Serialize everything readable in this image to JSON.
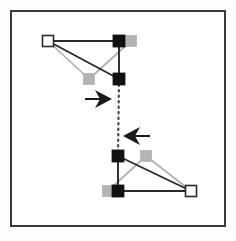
{
  "figure": {
    "width": 236,
    "height": 241,
    "background_color": "#fdfdfd",
    "panel_background_color": "#ffffff"
  },
  "frame": {
    "name": "outer-border",
    "x": 11,
    "y": 11,
    "width": 214,
    "height": 215,
    "stroke_color": "#3a3a3a",
    "stroke_width": 2.0
  },
  "palette": {
    "dark": "#1a1a1a",
    "mid_dark": "#4a4a4a",
    "gray": "#a8a8a8",
    "light_gray": "#c0c0c0",
    "white": "#ffffff",
    "frame": "#3a3a3a"
  },
  "markers": {
    "size_filled": 12,
    "size_gray": 11,
    "size_hollow": 11,
    "hollow_stroke_width": 1.6,
    "items": [
      {
        "id": "top-hollow-vertex",
        "group": "top",
        "style": "hollow",
        "fill": "#ffffff",
        "stroke": "#2a2a2a",
        "cx": 48,
        "cy": 41,
        "size": 11
      },
      {
        "id": "top-black-upper-right",
        "group": "top",
        "style": "filled",
        "fill": "#111111",
        "stroke": "#111111",
        "cx": 119,
        "cy": 41,
        "size": 12
      },
      {
        "id": "top-black-lower-right",
        "group": "top",
        "style": "filled",
        "fill": "#111111",
        "stroke": "#111111",
        "cx": 119,
        "cy": 79,
        "size": 12
      },
      {
        "id": "top-gray-upper-right",
        "group": "top",
        "style": "gray",
        "fill": "#b4b4b4",
        "stroke": "#b4b4b4",
        "cx": 131,
        "cy": 41,
        "size": 11
      },
      {
        "id": "top-gray-middle",
        "group": "top",
        "style": "gray",
        "fill": "#b4b4b4",
        "stroke": "#b4b4b4",
        "cx": 89,
        "cy": 79,
        "size": 11
      },
      {
        "id": "bottom-black-upper-left",
        "group": "bottom",
        "style": "filled",
        "fill": "#111111",
        "stroke": "#111111",
        "cx": 118,
        "cy": 156,
        "size": 12
      },
      {
        "id": "bottom-black-lower-left",
        "group": "bottom",
        "style": "filled",
        "fill": "#111111",
        "stroke": "#111111",
        "cx": 118,
        "cy": 191,
        "size": 12
      },
      {
        "id": "bottom-gray-upper",
        "group": "bottom",
        "style": "gray",
        "fill": "#b4b4b4",
        "stroke": "#b4b4b4",
        "cx": 146,
        "cy": 156,
        "size": 11
      },
      {
        "id": "bottom-gray-lower-left",
        "group": "bottom",
        "style": "gray",
        "fill": "#b4b4b4",
        "stroke": "#b4b4b4",
        "cx": 108,
        "cy": 191,
        "size": 11
      },
      {
        "id": "bottom-hollow-vertex",
        "group": "bottom",
        "style": "hollow",
        "fill": "#ffffff",
        "stroke": "#2a2a2a",
        "cx": 191,
        "cy": 191,
        "size": 11
      }
    ]
  },
  "edges": [
    {
      "id": "top-dark-top-edge",
      "group": "top",
      "shade": "dark",
      "color": "#2a2a2a",
      "width": 1.9,
      "x1": 48,
      "y1": 41,
      "x2": 119,
      "y2": 41
    },
    {
      "id": "top-dark-right-edge",
      "group": "top",
      "shade": "dark",
      "color": "#2a2a2a",
      "width": 1.9,
      "x1": 119,
      "y1": 41,
      "x2": 119,
      "y2": 79
    },
    {
      "id": "top-dark-hypotenuse",
      "group": "top",
      "shade": "dark",
      "color": "#2a2a2a",
      "width": 1.9,
      "x1": 48,
      "y1": 41,
      "x2": 119,
      "y2": 79
    },
    {
      "id": "top-gray-top-edge",
      "group": "top",
      "shade": "gray",
      "color": "#b0b0b0",
      "width": 1.7,
      "x1": 48,
      "y1": 41,
      "x2": 131,
      "y2": 41
    },
    {
      "id": "top-gray-right-edge",
      "group": "top",
      "shade": "gray",
      "color": "#b0b0b0",
      "width": 1.7,
      "x1": 131,
      "y1": 41,
      "x2": 89,
      "y2": 79
    },
    {
      "id": "top-gray-hypotenuse",
      "group": "top",
      "shade": "gray",
      "color": "#b0b0b0",
      "width": 1.7,
      "x1": 48,
      "y1": 41,
      "x2": 89,
      "y2": 79
    },
    {
      "id": "bottom-dark-left-edge",
      "group": "bottom",
      "shade": "dark",
      "color": "#2a2a2a",
      "width": 1.9,
      "x1": 118,
      "y1": 156,
      "x2": 118,
      "y2": 191
    },
    {
      "id": "bottom-dark-bottom-edge",
      "group": "bottom",
      "shade": "dark",
      "color": "#2a2a2a",
      "width": 1.9,
      "x1": 118,
      "y1": 191,
      "x2": 191,
      "y2": 191
    },
    {
      "id": "bottom-dark-hypotenuse",
      "group": "bottom",
      "shade": "dark",
      "color": "#2a2a2a",
      "width": 1.9,
      "x1": 118,
      "y1": 156,
      "x2": 191,
      "y2": 191
    },
    {
      "id": "bottom-gray-left-edge",
      "group": "bottom",
      "shade": "gray",
      "color": "#b0b0b0",
      "width": 1.7,
      "x1": 146,
      "y1": 156,
      "x2": 108,
      "y2": 191
    },
    {
      "id": "bottom-gray-bottom-edge",
      "group": "bottom",
      "shade": "gray",
      "color": "#b0b0b0",
      "width": 1.7,
      "x1": 108,
      "y1": 191,
      "x2": 191,
      "y2": 191
    },
    {
      "id": "bottom-gray-hypotenuse",
      "group": "bottom",
      "shade": "gray",
      "color": "#b0b0b0",
      "width": 1.7,
      "x1": 146,
      "y1": 156,
      "x2": 191,
      "y2": 191
    }
  ],
  "connector": {
    "id": "dotted-correspondence-line",
    "color": "#4a4a4a",
    "width": 2.2,
    "dash_pattern": "1.5 4",
    "x1": 119,
    "y1": 79,
    "x2": 118,
    "y2": 156
  },
  "arrows": [
    {
      "id": "arrow-right",
      "direction": "right",
      "color": "#1a1a1a",
      "tip_x": 112,
      "tip_y": 99,
      "tail_x": 85,
      "tail_y": 99,
      "head_length": 17,
      "head_half_height": 9,
      "notch": 5,
      "shaft_width": 2.0
    },
    {
      "id": "arrow-left",
      "direction": "left",
      "color": "#1a1a1a",
      "tip_x": 123,
      "tip_y": 136,
      "tail_x": 150,
      "tail_y": 136,
      "head_length": 17,
      "head_half_height": 9,
      "notch": 5,
      "shaft_width": 2.0
    }
  ],
  "chart_data": {
    "type": "scatter",
    "xlabel": "",
    "ylabel": "",
    "xlim": [
      11,
      225
    ],
    "ylim": [
      11,
      226
    ],
    "grid": false,
    "legend": null,
    "series": [
      {
        "name": "top shape - dark vertices",
        "marker": "square-filled",
        "color": "#111111",
        "points": [
          {
            "label": "hollow corner",
            "x": 48,
            "y": 41,
            "marker": "square-hollow"
          },
          {
            "label": "upper right",
            "x": 119,
            "y": 41
          },
          {
            "label": "lower right",
            "x": 119,
            "y": 79
          }
        ]
      },
      {
        "name": "top shape - gray vertices",
        "marker": "square-filled",
        "color": "#b4b4b4",
        "points": [
          {
            "label": "hollow corner",
            "x": 48,
            "y": 41,
            "marker": "square-hollow"
          },
          {
            "label": "upper right gray",
            "x": 131,
            "y": 41
          },
          {
            "label": "middle gray",
            "x": 89,
            "y": 79
          }
        ]
      },
      {
        "name": "bottom shape - dark vertices",
        "marker": "square-filled",
        "color": "#111111",
        "points": [
          {
            "label": "upper left",
            "x": 118,
            "y": 156
          },
          {
            "label": "lower left",
            "x": 118,
            "y": 191
          },
          {
            "label": "hollow corner",
            "x": 191,
            "y": 191,
            "marker": "square-hollow"
          }
        ]
      },
      {
        "name": "bottom shape - gray vertices",
        "marker": "square-filled",
        "color": "#b4b4b4",
        "points": [
          {
            "label": "upper gray",
            "x": 146,
            "y": 156
          },
          {
            "label": "lower left gray",
            "x": 108,
            "y": 191
          },
          {
            "label": "hollow corner",
            "x": 191,
            "y": 191,
            "marker": "square-hollow"
          }
        ]
      }
    ],
    "annotations": [
      {
        "type": "arrow",
        "direction": "right",
        "from": [
          85,
          99
        ],
        "to": [
          112,
          99
        ]
      },
      {
        "type": "arrow",
        "direction": "left",
        "from": [
          150,
          136
        ],
        "to": [
          123,
          136
        ]
      },
      {
        "type": "dotted-line",
        "from": [
          119,
          79
        ],
        "to": [
          118,
          156
        ]
      }
    ]
  }
}
